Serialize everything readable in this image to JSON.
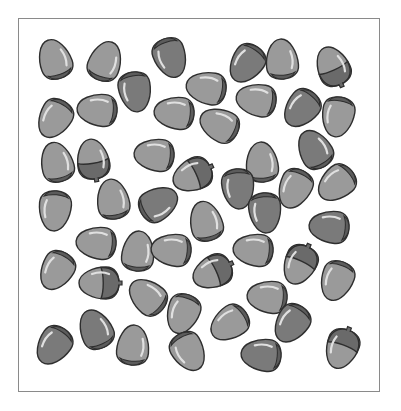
{
  "image": {
    "description": "Counting worksheet: acorns and capless acorn nuts scattered in a bordered box",
    "frame": {
      "x": 18,
      "y": 18,
      "width": 362,
      "height": 374,
      "border_color": "#8a8a8a"
    }
  },
  "colors": {
    "outline": "#2e2e2e",
    "nut_light": "#9a9a9a",
    "nut_dark": "#7a7a7a",
    "cap": "#6a6a6a",
    "base_band": "#5c5c5c",
    "highlight": "#e0e0e0",
    "background": "#ffffff"
  },
  "counts": {
    "acorns_with_cap": 7,
    "nuts_without_cap": 45,
    "total": 52
  },
  "items": [
    {
      "x": 55,
      "y": 60,
      "rot": -20,
      "shade": "light",
      "cap": false
    },
    {
      "x": 105,
      "y": 62,
      "rot": 20,
      "shade": "light",
      "cap": false
    },
    {
      "x": 170,
      "y": 57,
      "rot": 160,
      "shade": "dark",
      "cap": false
    },
    {
      "x": 247,
      "y": 63,
      "rot": 215,
      "shade": "dark",
      "cap": false
    },
    {
      "x": 282,
      "y": 60,
      "rot": -5,
      "shade": "light",
      "cap": false
    },
    {
      "x": 333,
      "y": 67,
      "rot": -25,
      "shade": "light",
      "cap": true
    },
    {
      "x": 135,
      "y": 91,
      "rot": 170,
      "shade": "dark",
      "cap": false
    },
    {
      "x": 207,
      "y": 88,
      "rot": -80,
      "shade": "light",
      "cap": false
    },
    {
      "x": 55,
      "y": 118,
      "rot": 210,
      "shade": "light",
      "cap": false
    },
    {
      "x": 98,
      "y": 110,
      "rot": -85,
      "shade": "light",
      "cap": false
    },
    {
      "x": 175,
      "y": 113,
      "rot": -85,
      "shade": "light",
      "cap": false
    },
    {
      "x": 220,
      "y": 125,
      "rot": -65,
      "shade": "light",
      "cap": false
    },
    {
      "x": 257,
      "y": 100,
      "rot": -80,
      "shade": "light",
      "cap": false
    },
    {
      "x": 302,
      "y": 108,
      "rot": 220,
      "shade": "dark",
      "cap": false
    },
    {
      "x": 338,
      "y": 116,
      "rot": 190,
      "shade": "light",
      "cap": false
    },
    {
      "x": 57,
      "y": 163,
      "rot": -15,
      "shade": "light",
      "cap": false
    },
    {
      "x": 93,
      "y": 160,
      "rot": -10,
      "shade": "light",
      "cap": true
    },
    {
      "x": 155,
      "y": 155,
      "rot": -85,
      "shade": "light",
      "cap": false
    },
    {
      "x": 193,
      "y": 175,
      "rot": -115,
      "shade": "light",
      "cap": true
    },
    {
      "x": 262,
      "y": 163,
      "rot": -5,
      "shade": "light",
      "cap": false
    },
    {
      "x": 315,
      "y": 150,
      "rot": -30,
      "shade": "dark",
      "cap": false
    },
    {
      "x": 238,
      "y": 188,
      "rot": 175,
      "shade": "dark",
      "cap": false
    },
    {
      "x": 295,
      "y": 188,
      "rot": 205,
      "shade": "light",
      "cap": false
    },
    {
      "x": 337,
      "y": 183,
      "rot": 230,
      "shade": "light",
      "cap": false
    },
    {
      "x": 113,
      "y": 200,
      "rot": -10,
      "shade": "light",
      "cap": false
    },
    {
      "x": 158,
      "y": 204,
      "rot": 60,
      "shade": "dark",
      "cap": false
    },
    {
      "x": 55,
      "y": 210,
      "rot": 185,
      "shade": "light",
      "cap": false
    },
    {
      "x": 206,
      "y": 222,
      "rot": -15,
      "shade": "light",
      "cap": false
    },
    {
      "x": 265,
      "y": 212,
      "rot": 175,
      "shade": "dark",
      "cap": false
    },
    {
      "x": 330,
      "y": 227,
      "rot": -85,
      "shade": "dark",
      "cap": false
    },
    {
      "x": 97,
      "y": 243,
      "rot": -85,
      "shade": "light",
      "cap": false
    },
    {
      "x": 138,
      "y": 252,
      "rot": 5,
      "shade": "light",
      "cap": false
    },
    {
      "x": 172,
      "y": 250,
      "rot": -85,
      "shade": "light",
      "cap": false
    },
    {
      "x": 254,
      "y": 250,
      "rot": -85,
      "shade": "light",
      "cap": false
    },
    {
      "x": 57,
      "y": 270,
      "rot": 210,
      "shade": "light",
      "cap": false
    },
    {
      "x": 100,
      "y": 283,
      "rot": -90,
      "shade": "light",
      "cap": true
    },
    {
      "x": 148,
      "y": 297,
      "rot": -50,
      "shade": "light",
      "cap": false
    },
    {
      "x": 213,
      "y": 272,
      "rot": -115,
      "shade": "light",
      "cap": true
    },
    {
      "x": 300,
      "y": 264,
      "rot": 205,
      "shade": "light",
      "cap": true
    },
    {
      "x": 337,
      "y": 280,
      "rot": 200,
      "shade": "light",
      "cap": false
    },
    {
      "x": 268,
      "y": 297,
      "rot": -85,
      "shade": "light",
      "cap": false
    },
    {
      "x": 183,
      "y": 313,
      "rot": 200,
      "shade": "light",
      "cap": false
    },
    {
      "x": 96,
      "y": 330,
      "rot": -25,
      "shade": "dark",
      "cap": false
    },
    {
      "x": 230,
      "y": 323,
      "rot": 235,
      "shade": "light",
      "cap": false
    },
    {
      "x": 292,
      "y": 323,
      "rot": 215,
      "shade": "dark",
      "cap": false
    },
    {
      "x": 54,
      "y": 345,
      "rot": 215,
      "shade": "dark",
      "cap": false
    },
    {
      "x": 133,
      "y": 346,
      "rot": 5,
      "shade": "light",
      "cap": false
    },
    {
      "x": 188,
      "y": 351,
      "rot": 150,
      "shade": "light",
      "cap": false
    },
    {
      "x": 262,
      "y": 355,
      "rot": -85,
      "shade": "dark",
      "cap": false
    },
    {
      "x": 342,
      "y": 348,
      "rot": 200,
      "shade": "light",
      "cap": true
    },
    {
      "x": 123,
      "y": 26,
      "rot": 0,
      "shade": "light",
      "cap": false,
      "hidden": true
    }
  ]
}
